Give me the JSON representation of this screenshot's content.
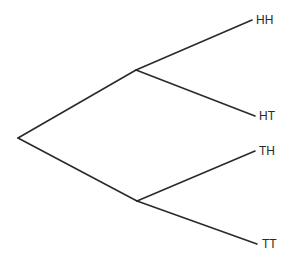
{
  "diagram": {
    "type": "probability-tree",
    "stroke_color": "#2a2a2a",
    "background": "#ffffff",
    "nodes": {
      "root": {
        "x": 18,
        "y": 138
      },
      "H": {
        "x": 136,
        "y": 70
      },
      "T": {
        "x": 137,
        "y": 201
      }
    },
    "leaves": [
      {
        "label": "HH",
        "x": 252,
        "y": 20,
        "parent": "H"
      },
      {
        "label": "HT",
        "x": 255,
        "y": 116,
        "parent": "H"
      },
      {
        "label": "TH",
        "x": 255,
        "y": 151,
        "parent": "T"
      },
      {
        "label": "TT",
        "x": 257,
        "y": 244,
        "parent": "T"
      }
    ]
  }
}
